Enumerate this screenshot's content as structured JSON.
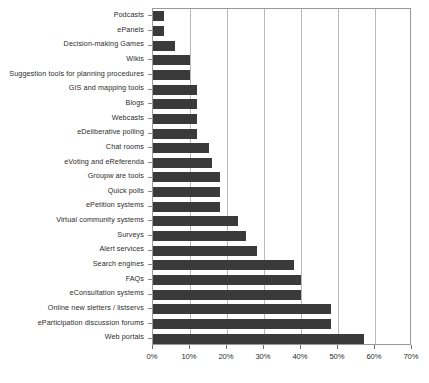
{
  "chart_data": {
    "type": "bar",
    "orientation": "horizontal",
    "title": "",
    "subtitle": "",
    "xlabel": "",
    "ylabel": "",
    "xlim": [
      0,
      70
    ],
    "xtick_labels": [
      "0%",
      "10%",
      "20%",
      "30%",
      "40%",
      "50%",
      "60%",
      "70%"
    ],
    "xtick_values": [
      0,
      10,
      20,
      30,
      40,
      50,
      60,
      70
    ],
    "grid": true,
    "legend": false,
    "legend_position": "none",
    "series_color": "#3a3a3a",
    "categories": [
      "Podcasts",
      "ePanels",
      "Decision-making Games",
      "Wikis",
      "Suggestion tools for planning procedures",
      "GIS and mapping tools",
      "Blogs",
      "Webcasts",
      "eDeliberative polling",
      "Chat rooms",
      "eVoting and eReferenda",
      "Groupw are tools",
      "Quick polls",
      "ePetition systems",
      "Virtual community systems",
      "Surveys",
      "Alert services",
      "Search engines",
      "FAQs",
      "eConsultation systems",
      "Online new sletters / listservs",
      "eParticipation discussion forums",
      "Web portals"
    ],
    "values": [
      3,
      3,
      6,
      10,
      10,
      12,
      12,
      12,
      12,
      15,
      16,
      18,
      18,
      18,
      23,
      25,
      28,
      38,
      40,
      40,
      48,
      48,
      57
    ]
  }
}
